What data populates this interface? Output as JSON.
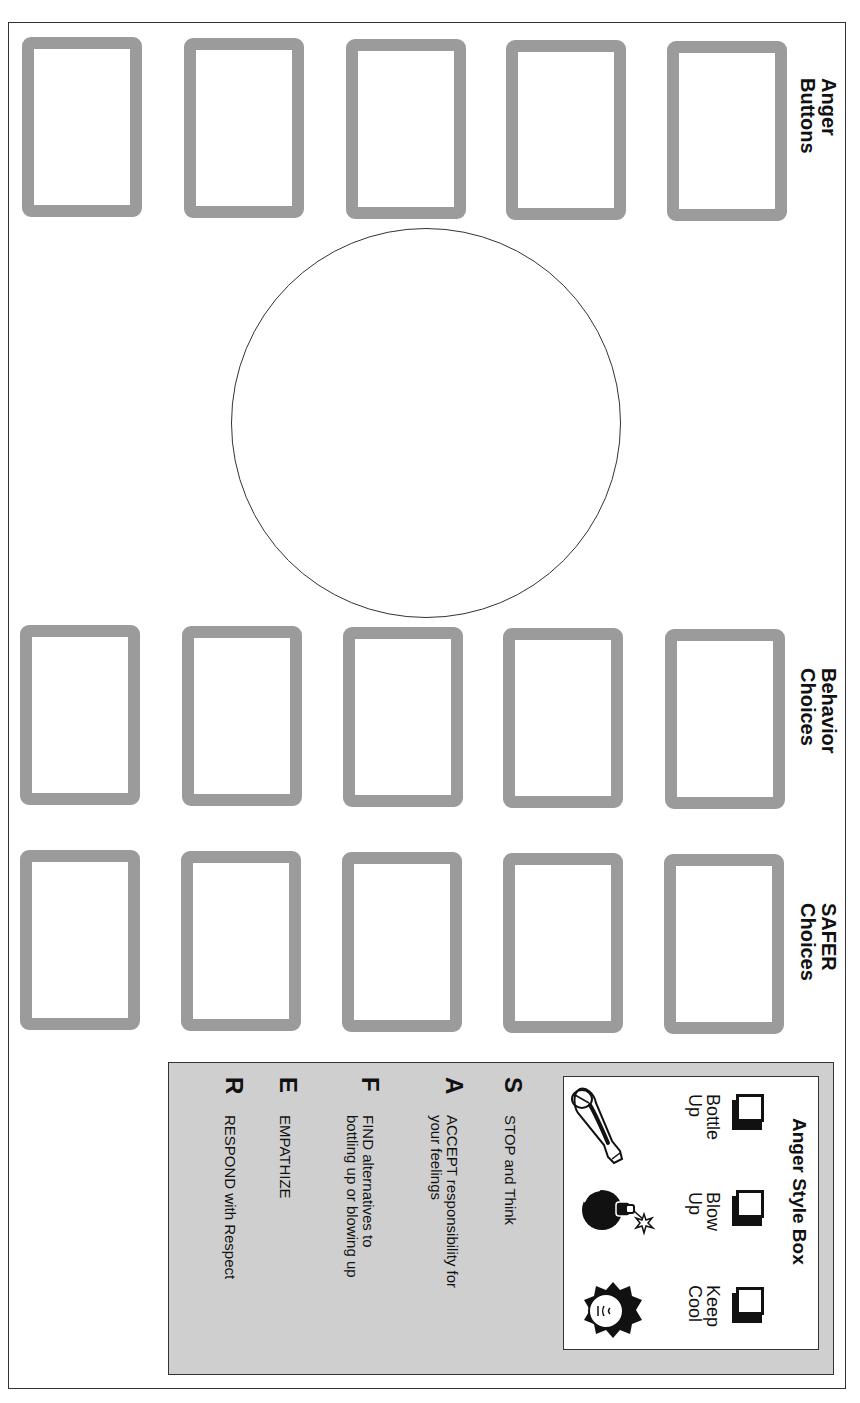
{
  "sections": {
    "anger_buttons": {
      "label_line1": "Anger",
      "label_line2": "Buttons",
      "card_count": 5
    },
    "behavior_choices": {
      "label_line1": "Behavior",
      "label_line2": "Choices",
      "card_count": 5
    },
    "safer_choices": {
      "label_line1": "SAFER",
      "label_line2": "Choices",
      "card_count": 5
    }
  },
  "center_circle": {
    "content": ""
  },
  "anger_style_box": {
    "title": "Anger Style Box",
    "options": [
      {
        "line1": "Bottle",
        "line2": "Up",
        "icon": "bottle-icon",
        "checked": false
      },
      {
        "line1": "Blow",
        "line2": "Up",
        "icon": "bomb-icon",
        "checked": false
      },
      {
        "line1": "Keep",
        "line2": "Cool",
        "icon": "cool-face-icon",
        "checked": false
      }
    ]
  },
  "safer_steps": [
    {
      "letter": "S",
      "line1": "STOP and Think",
      "line2": ""
    },
    {
      "letter": "A",
      "line1": "ACCEPT responsibility for",
      "line2": "your feelings"
    },
    {
      "letter": "F",
      "line1": "FIND alternatives to",
      "line2": "bottling up or blowing up"
    },
    {
      "letter": "E",
      "line1": "EMPATHIZE",
      "line2": ""
    },
    {
      "letter": "R",
      "line1": "RESPOND with Respect",
      "line2": ""
    }
  ],
  "colors": {
    "card_border": "#9b9b9b",
    "panel_gray": "#cfcfcf",
    "line": "#333333"
  }
}
